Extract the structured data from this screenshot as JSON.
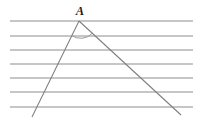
{
  "figure": {
    "background_color": "#ffffff",
    "line_color": "#8d8d8d",
    "ray_color": "#7e7e7e",
    "arc_color": "#9a9a9a",
    "label_color": "#1c1c1c",
    "vertex": {
      "label": "A",
      "x": 79,
      "y": 21,
      "label_x": 80,
      "label_y": 15
    },
    "parallel_lines": {
      "count": 7,
      "x_start": 10,
      "x_end": 193,
      "y_values": [
        21,
        36,
        50,
        64,
        78,
        92,
        107
      ]
    },
    "rays": [
      {
        "name": "left-ray",
        "x1": 79,
        "y1": 21,
        "x2": 32,
        "y2": 117
      },
      {
        "name": "right-ray",
        "x1": 79,
        "y1": 21,
        "x2": 181,
        "y2": 115
      }
    ],
    "angle_arc": {
      "center_x": 79,
      "center_y": 21,
      "radius": 16,
      "start_x": 71,
      "start_y": 35,
      "end_x": 92,
      "end_y": 33
    }
  }
}
